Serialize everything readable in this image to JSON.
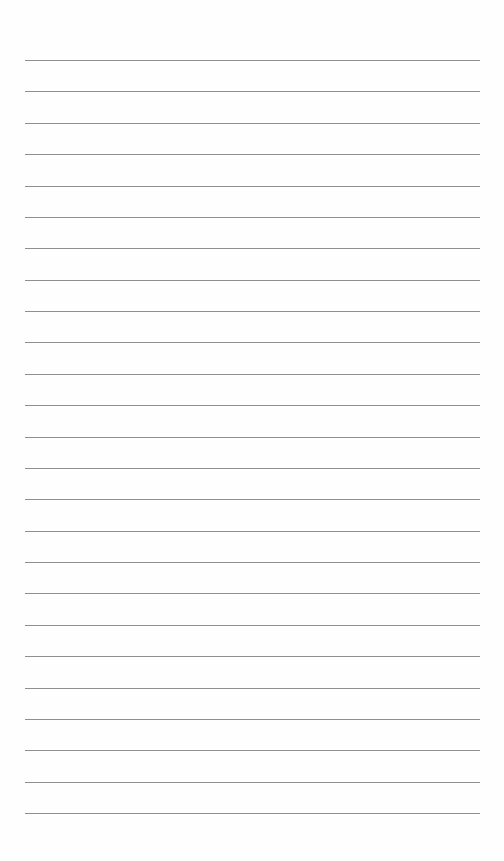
{
  "document": {
    "type": "ruled-paper",
    "title": "",
    "line_count": 25,
    "lines": [
      "",
      "",
      "",
      "",
      "",
      "",
      "",
      "",
      "",
      "",
      "",
      "",
      "",
      "",
      "",
      "",
      "",
      "",
      "",
      "",
      "",
      "",
      "",
      "",
      ""
    ],
    "colors": {
      "paper": "#fefefe",
      "rule": "#8f8f8f"
    }
  }
}
